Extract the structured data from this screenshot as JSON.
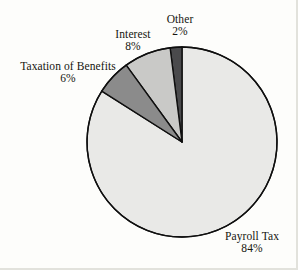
{
  "chart_data": {
    "type": "pie",
    "title": "",
    "subtitle": "",
    "xlabel": "",
    "ylabel": "",
    "legend_position": "none",
    "grid": false,
    "units": "percent",
    "total": 100,
    "start_angle_deg": 90,
    "direction": "counterclockwise",
    "categories": [
      "Payroll Tax",
      "Other",
      "Interest",
      "Taxation of Benefits"
    ],
    "values": [
      84,
      2,
      8,
      6
    ],
    "slices": [
      {
        "label": "Payroll Tax",
        "value": 84,
        "value_text": "84%",
        "color": "#e9e9e7",
        "label_position": "outside-bottom-right"
      },
      {
        "label": "Other",
        "value": 2,
        "value_text": "2%",
        "color": "#4a4a4c",
        "label_position": "outside-top"
      },
      {
        "label": "Interest",
        "value": 8,
        "value_text": "8%",
        "color": "#c9c9c7",
        "label_position": "outside-top-left"
      },
      {
        "label": "Taxation of Benefits",
        "value": 6,
        "value_text": "6%",
        "color": "#8b8b8b",
        "label_position": "outside-left"
      }
    ],
    "geometry": {
      "center_x": 182,
      "center_y": 142,
      "radius": 95
    },
    "style": {
      "background": "#fdfdfb",
      "outline_color": "#0f0f0f",
      "outline_width": 1.4,
      "text_color": "#15150f"
    }
  },
  "labels": {
    "payroll": {
      "name": "Payroll Tax",
      "value": "84%"
    },
    "other": {
      "name": "Other",
      "value": "2%"
    },
    "interest": {
      "name": "Interest",
      "value": "8%"
    },
    "taxation": {
      "name": "Taxation of Benefits",
      "value": "6%"
    }
  }
}
